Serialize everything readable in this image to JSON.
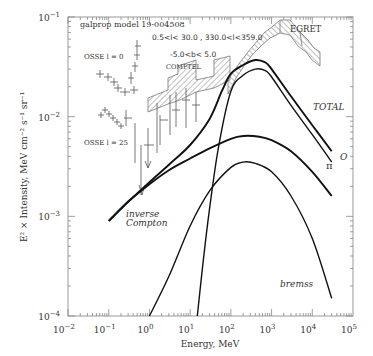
{
  "chart_data": {
    "type": "line",
    "title": "galprop model 19-004508",
    "xlabel": "Energy, MeV",
    "ylabel": "E^2 × Intensity, MeV cm^-2 s^-1 sr^-1",
    "xscale": "log",
    "yscale": "log",
    "xlim": [
      0.01,
      100000
    ],
    "ylim": [
      0.0001,
      0.1
    ],
    "x_ticks": [
      "10^-2",
      "10^-1",
      "10^0",
      "10^1",
      "10^2",
      "10^3",
      "10^4",
      "10^5"
    ],
    "y_ticks": [
      "10^-4",
      "10^-3",
      "10^-2",
      "10^-1"
    ],
    "annotations": [
      "galprop model 19-004508",
      "0.5<l< 30.0 , 330.0<l<359.0",
      "-5.0<b< 5.0",
      "COMPTEL",
      "EGRET",
      "OSSE l = 0",
      "OSSE l = 25",
      "inverse Compton",
      "TOTAL",
      "π0",
      "bremss"
    ],
    "grid": false,
    "legend": "none (inline labels)",
    "series": [
      {
        "name": "TOTAL",
        "x": [
          0.1,
          0.3,
          1,
          3,
          10,
          30,
          60,
          100,
          200,
          400,
          700,
          1000,
          3000,
          10000,
          30000
        ],
        "y": [
          0.0009,
          0.0014,
          0.0022,
          0.0033,
          0.0052,
          0.0095,
          0.018,
          0.027,
          0.033,
          0.037,
          0.035,
          0.03,
          0.016,
          0.0082,
          0.0045
        ]
      },
      {
        "name": "pi0",
        "x": [
          15,
          20,
          30,
          50,
          100,
          200,
          400,
          700,
          1000,
          3000,
          10000,
          30000
        ],
        "y": [
          0.0001,
          0.0003,
          0.0012,
          0.005,
          0.018,
          0.026,
          0.03,
          0.029,
          0.025,
          0.013,
          0.0066,
          0.0035
        ]
      },
      {
        "name": "inverse Compton",
        "x": [
          0.1,
          0.3,
          1,
          3,
          10,
          30,
          100,
          200,
          500,
          1000,
          3000,
          10000,
          30000
        ],
        "y": [
          0.0009,
          0.0014,
          0.0021,
          0.0029,
          0.0038,
          0.0048,
          0.006,
          0.0064,
          0.0063,
          0.0058,
          0.0045,
          0.0028,
          0.0016
        ]
      },
      {
        "name": "bremss",
        "x": [
          1,
          3,
          10,
          30,
          100,
          200,
          400,
          1000,
          3000,
          10000,
          30000
        ],
        "y": [
          0.0001,
          0.00025,
          0.0008,
          0.0018,
          0.0031,
          0.0035,
          0.0034,
          0.0028,
          0.0016,
          0.0006,
          0.00015
        ]
      }
    ],
    "data_sets": [
      {
        "name": "OSSE l = 0",
        "x_range": [
          0.07,
          0.6
        ],
        "y_range": [
          0.018,
          0.05
        ]
      },
      {
        "name": "OSSE l = 25",
        "x_range": [
          0.07,
          0.6
        ],
        "y_range": [
          0.0045,
          0.011
        ]
      },
      {
        "name": "COMPTEL",
        "x_range": [
          1,
          30
        ],
        "y_range": [
          0.009,
          0.022
        ]
      },
      {
        "name": "EGRET",
        "x_range": [
          30,
          20000
        ],
        "y_range": [
          0.02,
          0.07
        ]
      }
    ]
  },
  "labels": {
    "model": "galprop model 19-004508",
    "lrange": "0.5<l< 30.0 , 330.0<l<359.0",
    "brange": "-5.0<b< 5.0",
    "comptel": "COMPTEL",
    "egret": "EGRET",
    "osse0": "OSSE l = 0",
    "osse25": "OSSE l = 25",
    "ic1": "inverse",
    "ic2": "Compton",
    "total": "TOTAL",
    "pi": "π",
    "pi_sup": "O",
    "bremss": "bremss",
    "xlabel": "Energy, MeV",
    "ylabel": "E² × Intensity, MeV cm⁻² s⁻¹ sr⁻¹"
  },
  "axes": {
    "x_ticks": [
      {
        "base": "10",
        "exp": "−2"
      },
      {
        "base": "10",
        "exp": "−1"
      },
      {
        "base": "10",
        "exp": "0"
      },
      {
        "base": "10",
        "exp": "1"
      },
      {
        "base": "10",
        "exp": "2"
      },
      {
        "base": "10",
        "exp": "3"
      },
      {
        "base": "10",
        "exp": "4"
      },
      {
        "base": "10",
        "exp": "5"
      }
    ],
    "y_ticks": [
      {
        "base": "10",
        "exp": "−1"
      },
      {
        "base": "10",
        "exp": "−2"
      },
      {
        "base": "10",
        "exp": "−3"
      },
      {
        "base": "10",
        "exp": "−4"
      }
    ]
  }
}
